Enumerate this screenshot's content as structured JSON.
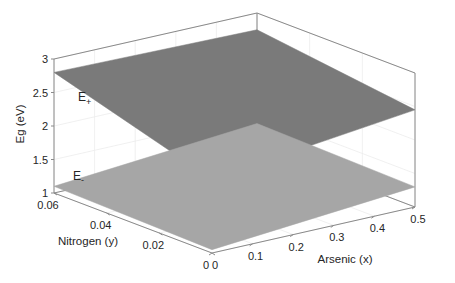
{
  "chart_data": {
    "type": "surface3d",
    "title": "",
    "xlabel": "Arsenic (x)",
    "ylabel": "Nitrogen (y)",
    "zlabel": "Eg (eV)",
    "xlim": [
      0,
      0.5
    ],
    "ylim": [
      0,
      0.06
    ],
    "zlim": [
      1,
      3
    ],
    "x_ticks": [
      "0",
      "0.1",
      "0.2",
      "0.3",
      "0.4",
      "0.5"
    ],
    "y_ticks": [
      "0",
      "0.02",
      "0.04",
      "0.06"
    ],
    "z_ticks": [
      "1",
      "1.5",
      "2",
      "2.5",
      "3"
    ],
    "grid": true,
    "series": [
      {
        "name": "E+",
        "label_main": "E",
        "label_sub": "+",
        "color": "#7a7a7a",
        "corners": {
          "x0_y0": 2.1,
          "x05_y0": 2.45,
          "x0_y006": 2.8,
          "x05_y006": 2.75
        }
      },
      {
        "name": "E-",
        "label_main": "E",
        "label_sub": "-",
        "color": "#a6a6a6",
        "corners": {
          "x0_y0": 1.05,
          "x05_y0": 1.3,
          "x0_y006": 1.1,
          "x05_y006": 1.35
        }
      }
    ]
  }
}
